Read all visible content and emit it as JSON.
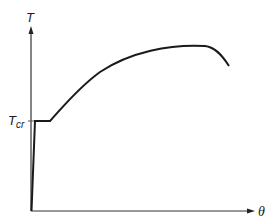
{
  "diagram": {
    "y_axis_label": "T",
    "x_axis_label": "θ",
    "tcr_label_main": "T",
    "tcr_label_sub": "cr",
    "colors": {
      "line": "#1a1a1a",
      "axis": "#333333",
      "background": "#ffffff"
    },
    "curve_description": "Steep rise from origin to T_cr, short plateau at T_cr, then concave-down increase to a maximum and a decline"
  }
}
